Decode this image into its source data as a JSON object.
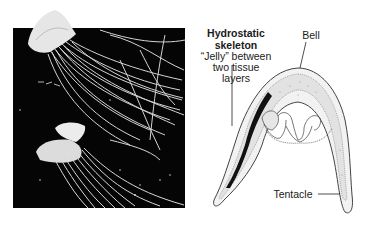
{
  "figure": {
    "photo": {
      "description": "Photograph of two jellyfish with long trailing tentacles on black background"
    },
    "diagram": {
      "description": "Cross-section of a jellyfish bell showing two tissue layers with jelly between"
    },
    "labels": {
      "title_line1": "Hydrostatic",
      "title_line2": "skeleton",
      "jelly_line1": "“Jelly” between",
      "jelly_line2": "two tissue",
      "jelly_line3": "layers",
      "bell": "Bell",
      "tentacle": "Tentacle"
    },
    "colors": {
      "photo_background": "#050505",
      "tentacle_strokes": "#e8e8e8",
      "ink": "#1a1a1a",
      "stipple": "#9a9a9a"
    }
  }
}
